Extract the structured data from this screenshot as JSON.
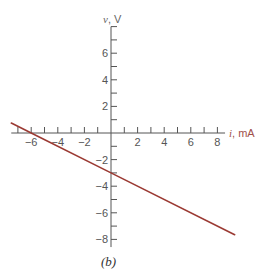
{
  "chart_data": {
    "type": "line",
    "title": "",
    "caption": "(b)",
    "xlabel": "i, mA",
    "ylabel": "v, V",
    "xlabel_var": "i",
    "xlabel_unit": ", mA",
    "ylabel_var": "v",
    "ylabel_unit": ", V",
    "xlim": [
      -7.5,
      8.5
    ],
    "ylim": [
      -8.5,
      8
    ],
    "x_ticks": [
      -6,
      -4,
      -2,
      2,
      4,
      6,
      8
    ],
    "y_ticks": [
      -8,
      -6,
      -4,
      -2,
      2,
      4,
      6
    ],
    "x_tick_labels": [
      "−6",
      "−4",
      "−2",
      "2",
      "4",
      "6",
      "8"
    ],
    "y_tick_labels": [
      "−8",
      "−6",
      "−4",
      "−2",
      "2",
      "4",
      "6"
    ],
    "minor_tick_step": 1,
    "grid": false,
    "legend": null,
    "series": [
      {
        "name": "v-i characteristic",
        "equation": "v = -0.5 i - 3",
        "color": "#9b3a33",
        "x": [
          -7.5,
          -6,
          0,
          9.3
        ],
        "y": [
          0.75,
          0,
          -3,
          -7.65
        ]
      }
    ],
    "intercepts": {
      "i_axis": -6,
      "v_axis": -3
    }
  },
  "colors": {
    "axis": "#555555",
    "line": "#9b3a33",
    "x_label": "#a0504a",
    "y_label": "#666666"
  }
}
